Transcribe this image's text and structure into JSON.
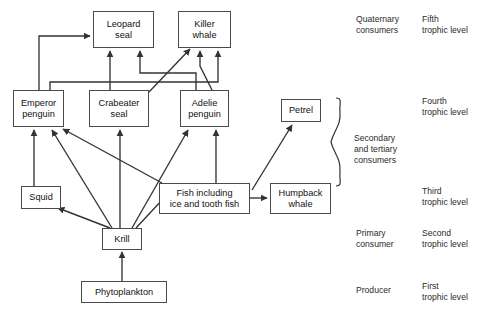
{
  "diagram": {
    "stroke_color": "#333333",
    "box_border_color": "#4a4a4a",
    "background": "#ffffff",
    "nodes": [
      {
        "id": "leopard_seal",
        "label": "Leopard\nseal",
        "x": 93,
        "y": 11,
        "w": 61,
        "h": 37
      },
      {
        "id": "killer_whale",
        "label": "Killer\nwhale",
        "x": 178,
        "y": 11,
        "w": 53,
        "h": 37
      },
      {
        "id": "emperor_penguin",
        "label": "Emperor\npenguin",
        "x": 13,
        "y": 90,
        "w": 51,
        "h": 37
      },
      {
        "id": "crabeater_seal",
        "label": "Crabeater\nseal",
        "x": 89,
        "y": 90,
        "w": 60,
        "h": 37
      },
      {
        "id": "adelie_penguin",
        "label": "Adelie\npenguin",
        "x": 180,
        "y": 90,
        "w": 49,
        "h": 37
      },
      {
        "id": "petrel",
        "label": "Petrel",
        "x": 281,
        "y": 99,
        "w": 40,
        "h": 23
      },
      {
        "id": "squid",
        "label": "Squid",
        "x": 21,
        "y": 186,
        "w": 40,
        "h": 23
      },
      {
        "id": "fish",
        "label": "Fish including\nice and tooth fish",
        "x": 159,
        "y": 183,
        "w": 91,
        "h": 31
      },
      {
        "id": "humpback_whale",
        "label": "Humpback\nwhale",
        "x": 270,
        "y": 183,
        "w": 61,
        "h": 31
      },
      {
        "id": "krill",
        "label": "Krill",
        "x": 102,
        "y": 228,
        "w": 40,
        "h": 22
      },
      {
        "id": "phytoplankton",
        "label": "Phytoplankton",
        "x": 81,
        "y": 281,
        "w": 86,
        "h": 22
      }
    ],
    "edges": [
      {
        "from": "emperor_penguin",
        "to": "leopard_seal",
        "kind": "elbow-up-right"
      },
      {
        "from": "crabeater_seal",
        "to": "leopard_seal",
        "kind": "vertical"
      },
      {
        "from": "adelie_penguin",
        "to": "leopard_seal",
        "kind": "elbow"
      },
      {
        "from": "emperor_penguin",
        "to": "killer_whale",
        "kind": "elbow"
      },
      {
        "from": "crabeater_seal",
        "to": "killer_whale",
        "kind": "diagonal"
      },
      {
        "from": "adelie_penguin",
        "to": "killer_whale",
        "kind": "vertical"
      },
      {
        "from": "krill",
        "to": "emperor_penguin",
        "kind": "diagonal"
      },
      {
        "from": "squid",
        "to": "emperor_penguin",
        "kind": "vertical"
      },
      {
        "from": "fish",
        "to": "emperor_penguin",
        "kind": "diagonal"
      },
      {
        "from": "krill",
        "to": "crabeater_seal",
        "kind": "vertical"
      },
      {
        "from": "krill",
        "to": "adelie_penguin",
        "kind": "diagonal"
      },
      {
        "from": "fish",
        "to": "adelie_penguin",
        "kind": "vertical"
      },
      {
        "from": "fish",
        "to": "petrel",
        "kind": "diagonal"
      },
      {
        "from": "krill",
        "to": "squid",
        "kind": "diagonal"
      },
      {
        "from": "krill",
        "to": "fish",
        "kind": "diagonal"
      },
      {
        "from": "fish",
        "to": "humpback_whale",
        "kind": "horizontal"
      },
      {
        "from": "phytoplankton",
        "to": "krill",
        "kind": "vertical"
      }
    ]
  },
  "legend": {
    "consumer_labels": [
      {
        "id": "quaternary",
        "text": "Quaternary\nconsumers",
        "x": 356,
        "y": 14
      },
      {
        "id": "secondary",
        "text": "Secondary\nand tertiary\nconsumers",
        "x": 354,
        "y": 133
      },
      {
        "id": "primary",
        "text": "Primary\nconsumer",
        "x": 356,
        "y": 228
      },
      {
        "id": "producer",
        "text": "Producer",
        "x": 356,
        "y": 285
      }
    ],
    "trophic_labels": [
      {
        "id": "fifth",
        "text": "Fifth\ntrophic level",
        "x": 422,
        "y": 14
      },
      {
        "id": "fourth",
        "text": "Fourth\ntrophic level",
        "x": 422,
        "y": 96
      },
      {
        "id": "third",
        "text": "Third\ntrophic level",
        "x": 422,
        "y": 186
      },
      {
        "id": "second",
        "text": "Second\ntrophic level",
        "x": 422,
        "y": 228
      },
      {
        "id": "first",
        "text": "First\ntrophic level",
        "x": 422,
        "y": 281
      }
    ]
  }
}
